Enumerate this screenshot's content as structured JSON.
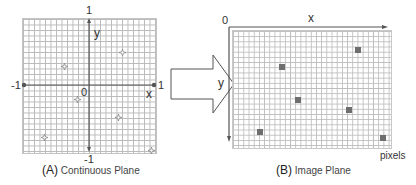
{
  "panel_a": {
    "caption_letter": "(A)",
    "caption_text": "Continuous Plane",
    "axis_labels": {
      "x": "x",
      "y": "y",
      "origin": "0"
    },
    "tick_labels": {
      "x_min": "-1",
      "x_max": "1",
      "y_min": "-1",
      "y_max": "1"
    },
    "points": [
      {
        "x": 0.5,
        "y": 0.6,
        "px": 122,
        "py": 45
      },
      {
        "x": -0.38,
        "y": 0.39,
        "px": 64,
        "py": 59
      },
      {
        "x": -0.18,
        "y": -0.1,
        "px": 77,
        "py": 92
      },
      {
        "x": 0.44,
        "y": -0.38,
        "px": 118,
        "py": 110
      },
      {
        "x": -0.68,
        "y": -0.68,
        "px": 44,
        "py": 130
      },
      {
        "x": 0.94,
        "y": -0.88,
        "px": 151,
        "py": 143
      }
    ]
  },
  "transform_arrow": {
    "direction": "right"
  },
  "panel_b": {
    "caption_letter": "(B)",
    "caption_text": "Image Plane",
    "axis_labels": {
      "x": "x",
      "y": "y",
      "origin": "0"
    },
    "unit_label": "pixels",
    "pixels": [
      {
        "px": 358,
        "py": 50
      },
      {
        "px": 282,
        "py": 67
      },
      {
        "px": 298,
        "py": 100
      },
      {
        "px": 349,
        "py": 110
      },
      {
        "px": 260,
        "py": 132
      },
      {
        "px": 383,
        "py": 138
      }
    ]
  },
  "colors": {
    "grid": "#b9b9b9",
    "axis": "#555555",
    "pixel_fill": "#6e6e6e",
    "marker": "#888888"
  }
}
